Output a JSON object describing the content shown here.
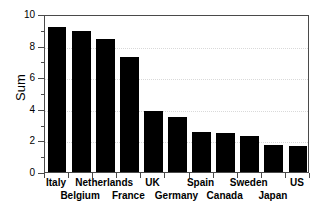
{
  "chart_data": {
    "type": "bar",
    "title": "",
    "xlabel": "",
    "ylabel": "Sum",
    "categories": [
      "Italy",
      "Belgium",
      "Netherlands",
      "France",
      "UK",
      "Germany",
      "Spain",
      "Canada",
      "Sweden",
      "Japan",
      "US"
    ],
    "values": [
      9.2,
      8.9,
      8.4,
      7.3,
      3.85,
      3.5,
      2.55,
      2.45,
      2.25,
      1.7,
      1.65
    ],
    "ylim": [
      0,
      10
    ],
    "y_major_ticks": [
      0,
      2,
      4,
      6,
      8,
      10
    ],
    "y_minor_ticks": [
      1,
      3,
      5,
      7,
      9
    ],
    "y_tick_labels": [
      "0",
      "2",
      "4",
      "6",
      "8",
      "10"
    ],
    "grid": true,
    "grid_axis": "y",
    "legend": false,
    "bar_color": "#000000",
    "grid_color": "#d9d9d9",
    "axis_color": "#4a4a4a",
    "label_rows": [
      0,
      1,
      0,
      1,
      0,
      1,
      0,
      1,
      0,
      1,
      0
    ]
  }
}
